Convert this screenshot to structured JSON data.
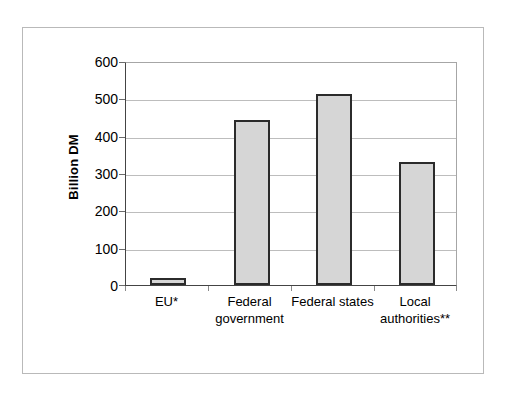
{
  "chart_data": {
    "type": "bar",
    "title": "",
    "xlabel": "",
    "ylabel": "Billion DM",
    "categories": [
      "EU*",
      "Federal government",
      "Federal states",
      "Local authorities**"
    ],
    "category_lines": [
      [
        "EU*"
      ],
      [
        "Federal",
        "government"
      ],
      [
        "Federal states"
      ],
      [
        "Local",
        "authorities**"
      ]
    ],
    "values": [
      20,
      443,
      511,
      330
    ],
    "ylim": [
      0,
      600
    ],
    "ytick_values": [
      0,
      100,
      200,
      300,
      400,
      500,
      600
    ],
    "ytick_labels": [
      "0",
      "100",
      "200",
      "300",
      "400",
      "500",
      "600"
    ],
    "grid": "horizontal",
    "legend": "none",
    "bar_fill_color": "#d6d6d6",
    "bar_edge_color": "#2b2b2b",
    "gridline_color": "#bdbdbd",
    "axis_color": "#444444",
    "background_color": "#ffffff"
  }
}
